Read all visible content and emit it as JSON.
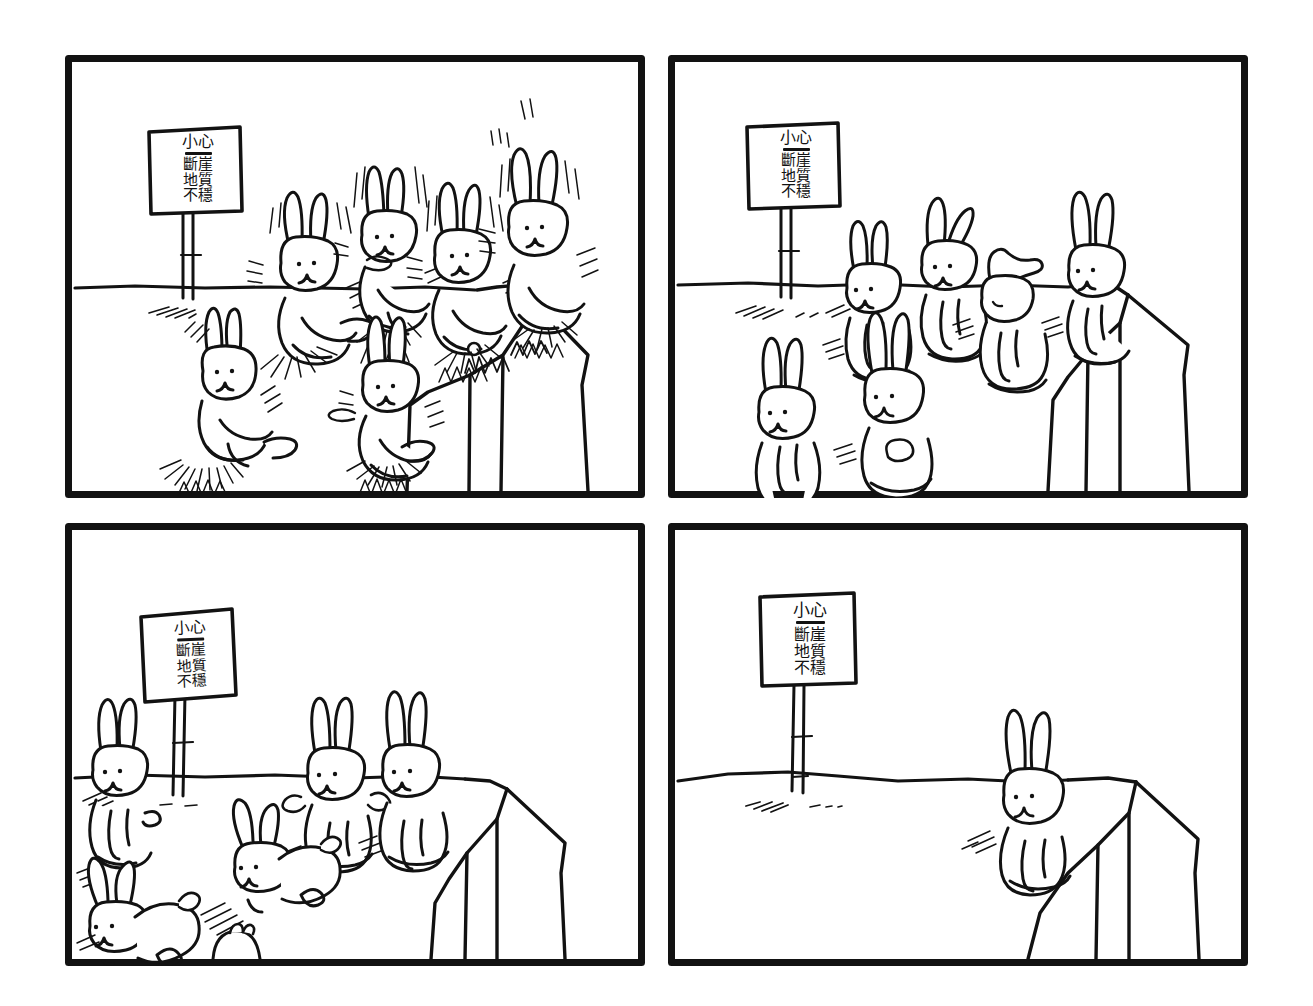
{
  "comic": {
    "title": "Caution Cliff Unstable Ground — four panel bunny comic",
    "ink_color": "#121212",
    "paper_color": "#ffffff",
    "panel_border_width_px": 7,
    "panel_count": 4,
    "sign": {
      "heading": "小心",
      "divider": true,
      "lines": [
        "斷崖",
        "地質",
        "不穩"
      ],
      "full_text": "小心 斷崖 地質 不穩",
      "translation_note": "Caution — Cliff, Unstable Ground"
    },
    "panels": [
      {
        "index": 1,
        "position": "top-left",
        "caption": "Seven bunnies bounce and leap wildly in front of the warning sign, kicking up dust clouds and speed lines near the cliff edge.",
        "bunny_count": 7,
        "bunny_state": "jumping",
        "has_sign": true,
        "has_cliff": true,
        "has_motion_lines": true,
        "has_dust": true
      },
      {
        "index": 2,
        "position": "top-right",
        "caption": "Six bunnies stand still and alert on the flat ground; one at the cliff lip peers over the edge.",
        "bunny_count": 6,
        "bunny_state": "standing",
        "has_sign": true,
        "has_cliff": true,
        "has_motion_lines": true,
        "has_dust": false
      },
      {
        "index": 3,
        "position": "bottom-left",
        "caption": "The bunnies hop away from the cliff; one rump disappears below the bottom panel border.",
        "bunny_count": 6,
        "bunny_state": "hopping away",
        "has_sign": true,
        "has_cliff": true,
        "has_motion_lines": true,
        "has_dust": false
      },
      {
        "index": 4,
        "position": "bottom-right",
        "caption": "Only one bunny remains, sitting quietly beside the empty cliff beneath the warning sign.",
        "bunny_count": 1,
        "bunny_state": "sitting alone",
        "has_sign": true,
        "has_cliff": true,
        "has_motion_lines": true,
        "has_dust": false
      }
    ]
  }
}
